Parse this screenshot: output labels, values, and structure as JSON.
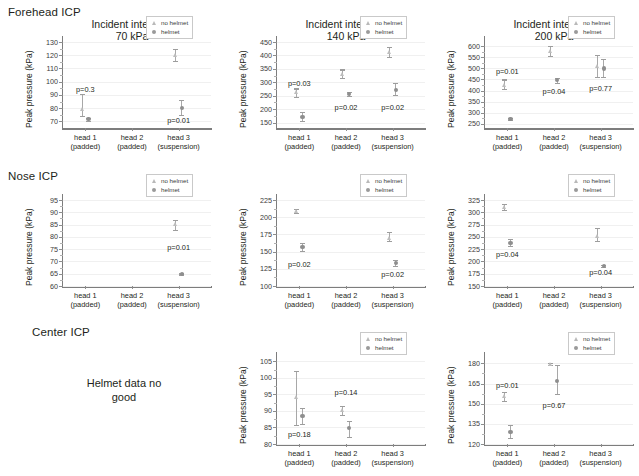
{
  "row_labels": [
    {
      "text": "Forehead ICP",
      "x": 8,
      "y": 6
    },
    {
      "text": "Nose ICP",
      "x": 8,
      "y": 170
    },
    {
      "text": "Center ICP",
      "x": 32,
      "y": 326
    }
  ],
  "legend": {
    "no_helmet": "no helmet",
    "helmet": "helmet",
    "no_helmet_icon": "triangle-marker-icon",
    "helmet_icon": "circle-marker-icon"
  },
  "note": {
    "line1": "Helmet data no",
    "line2": "good"
  },
  "axis_titles": {
    "y": "Peak pressure (kPa)"
  },
  "x_categories": [
    {
      "name": "head 1",
      "sub": "(padded)"
    },
    {
      "name": "head 2",
      "sub": "(padded)"
    },
    {
      "name": "head 3",
      "sub": "(suspension)"
    }
  ],
  "chart_data": [
    {
      "id": "forehead-70",
      "type": "scatter",
      "title": "Incident intensity:",
      "subtitle": "70 kPa",
      "row": "Forehead ICP",
      "ylabel": "Peak pressure (kPa)",
      "ylim": [
        65,
        130
      ],
      "yticks": [
        70,
        80,
        90,
        100,
        110,
        120,
        130
      ],
      "categories": [
        "head 1 (padded)",
        "head 2 (padded)",
        "head 3 (suspension)"
      ],
      "series": [
        {
          "name": "no helmet",
          "points": [
            {
              "category": "head 1",
              "value": 79.0,
              "low": 74.0,
              "high": 91.0
            },
            {
              "category": "head 2",
              "value": null,
              "low": null,
              "high": null
            },
            {
              "category": "head 3",
              "value": 120.0,
              "low": 115.5,
              "high": 124.5
            }
          ]
        },
        {
          "name": "helmet",
          "points": [
            {
              "category": "head 1",
              "value": 71.5,
              "low": 70.5,
              "high": 72.5
            },
            {
              "category": "head 2",
              "value": null,
              "low": null,
              "high": null
            },
            {
              "category": "head 3",
              "value": 80.0,
              "low": 75.0,
              "high": 86.0
            }
          ]
        }
      ],
      "annotations": [
        {
          "text": "p=0.3",
          "category": "head 1",
          "value": 93.5
        },
        {
          "text": "p=0.01",
          "category": "head 3",
          "value": 70.5
        }
      ]
    },
    {
      "id": "forehead-140",
      "type": "scatter",
      "title": "Incident intensity:",
      "subtitle": "140 kPa",
      "row": "Forehead ICP",
      "ylabel": "Peak pressure (kPa)",
      "ylim": [
        130,
        450
      ],
      "yticks": [
        150,
        200,
        250,
        300,
        350,
        400,
        450
      ],
      "categories": [
        "head 1 (padded)",
        "head 2 (padded)",
        "head 3 (suspension)"
      ],
      "series": [
        {
          "name": "no helmet",
          "points": [
            {
              "category": "head 1",
              "value": 262.0,
              "low": 246.0,
              "high": 277.0
            },
            {
              "category": "head 2",
              "value": 330.0,
              "low": 315.0,
              "high": 348.0
            },
            {
              "category": "head 3",
              "value": 412.0,
              "low": 393.0,
              "high": 430.0
            }
          ]
        },
        {
          "name": "helmet",
          "points": [
            {
              "category": "head 1",
              "value": 172.0,
              "low": 157.0,
              "high": 190.0
            },
            {
              "category": "head 2",
              "value": 257.0,
              "low": 250.0,
              "high": 265.0
            },
            {
              "category": "head 3",
              "value": 272.0,
              "low": 252.0,
              "high": 296.0
            }
          ]
        }
      ],
      "annotations": [
        {
          "text": "p=0.03",
          "category": "head 1",
          "value": 292.0
        },
        {
          "text": "p=0.02",
          "category": "head 2",
          "value": 203.0
        },
        {
          "text": "p=0.02",
          "category": "head 3",
          "value": 205.0
        }
      ]
    },
    {
      "id": "forehead-200",
      "type": "scatter",
      "title": "Incident intensity:",
      "subtitle": "200 kPa",
      "row": "Forehead ICP",
      "ylabel": "Peak pressure (kPa)",
      "ylim": [
        230,
        620
      ],
      "yticks": [
        250,
        300,
        350,
        400,
        450,
        500,
        550,
        600
      ],
      "categories": [
        "head 1 (padded)",
        "head 2 (padded)",
        "head 3 (suspension)"
      ],
      "series": [
        {
          "name": "no helmet",
          "points": [
            {
              "category": "head 1",
              "value": 425.0,
              "low": 408.0,
              "high": 450.0
            },
            {
              "category": "head 2",
              "value": 578.0,
              "low": 556.0,
              "high": 602.0
            },
            {
              "category": "head 3",
              "value": 512.0,
              "low": 460.0,
              "high": 562.0
            }
          ]
        },
        {
          "name": "helmet",
          "points": [
            {
              "category": "head 1",
              "value": 272.0,
              "low": 268.0,
              "high": 277.0
            },
            {
              "category": "head 2",
              "value": 446.0,
              "low": 436.0,
              "high": 455.0
            },
            {
              "category": "head 3",
              "value": 500.0,
              "low": 462.0,
              "high": 545.0
            }
          ]
        }
      ],
      "annotations": [
        {
          "text": "p=0.01",
          "category": "head 1",
          "value": 483.0
        },
        {
          "text": "p=0.04",
          "category": "head 2",
          "value": 392.0
        },
        {
          "text": "p=0.77",
          "category": "head 3",
          "value": 408.0
        }
      ]
    },
    {
      "id": "nose-70",
      "type": "scatter",
      "title": "",
      "subtitle": "",
      "row": "Nose ICP",
      "ylabel": "Peak pressure (kPa)",
      "ylim": [
        60,
        95
      ],
      "yticks": [
        60,
        65,
        70,
        75,
        80,
        85,
        90,
        95
      ],
      "categories": [
        "head 1 (padded)",
        "head 2 (padded)",
        "head 3 (suspension)"
      ],
      "series": [
        {
          "name": "no helmet",
          "points": [
            {
              "category": "head 1",
              "value": null,
              "low": null,
              "high": null
            },
            {
              "category": "head 2",
              "value": null,
              "low": null,
              "high": null
            },
            {
              "category": "head 3",
              "value": 85.3,
              "low": 82.8,
              "high": 87.0
            }
          ]
        },
        {
          "name": "helmet",
          "points": [
            {
              "category": "head 1",
              "value": null,
              "low": null,
              "high": null
            },
            {
              "category": "head 2",
              "value": null,
              "low": null,
              "high": null
            },
            {
              "category": "head 3",
              "value": 65.0,
              "low": 64.7,
              "high": 65.3
            }
          ]
        }
      ],
      "annotations": [
        {
          "text": "p=0.01",
          "category": "head 3",
          "value": 75.5
        }
      ]
    },
    {
      "id": "nose-140",
      "type": "scatter",
      "title": "",
      "subtitle": "",
      "row": "Nose ICP",
      "ylabel": "Peak pressure (kPa)",
      "ylim": [
        100,
        225
      ],
      "yticks": [
        100,
        125,
        150,
        175,
        200,
        225
      ],
      "categories": [
        "head 1 (padded)",
        "head 2 (padded)",
        "head 3 (suspension)"
      ],
      "series": [
        {
          "name": "no helmet",
          "points": [
            {
              "category": "head 1",
              "value": 209.0,
              "low": 206.0,
              "high": 212.0
            },
            {
              "category": "head 2",
              "value": null,
              "low": null,
              "high": null
            },
            {
              "category": "head 3",
              "value": 170.0,
              "low": 165.0,
              "high": 179.0
            }
          ]
        },
        {
          "name": "helmet",
          "points": [
            {
              "category": "head 1",
              "value": 157.0,
              "low": 151.0,
              "high": 163.0
            },
            {
              "category": "head 2",
              "value": null,
              "low": null,
              "high": null
            },
            {
              "category": "head 3",
              "value": 133.0,
              "low": 129.0,
              "high": 138.0
            }
          ]
        }
      ],
      "annotations": [
        {
          "text": "p=0.02",
          "category": "head 1",
          "value": 130.0
        },
        {
          "text": "p=0.02",
          "category": "head 3",
          "value": 116.0
        }
      ]
    },
    {
      "id": "nose-200",
      "type": "scatter",
      "title": "",
      "subtitle": "",
      "row": "Nose ICP",
      "ylabel": "Peak pressure (kPa)",
      "ylim": [
        150,
        325
      ],
      "yticks": [
        150,
        175,
        200,
        225,
        250,
        275,
        300,
        325
      ],
      "categories": [
        "head 1 (padded)",
        "head 2 (padded)",
        "head 3 (suspension)"
      ],
      "series": [
        {
          "name": "no helmet",
          "points": [
            {
              "category": "head 1",
              "value": 310.0,
              "low": 305.0,
              "high": 317.0
            },
            {
              "category": "head 2",
              "value": null,
              "low": null,
              "high": null
            },
            {
              "category": "head 3",
              "value": 252.0,
              "low": 241.0,
              "high": 268.0
            }
          ]
        },
        {
          "name": "helmet",
          "points": [
            {
              "category": "head 1",
              "value": 238.0,
              "low": 231.0,
              "high": 245.0
            },
            {
              "category": "head 2",
              "value": null,
              "low": null,
              "high": null
            },
            {
              "category": "head 3",
              "value": 191.0,
              "low": 189.0,
              "high": 193.0
            }
          ]
        }
      ],
      "annotations": [
        {
          "text": "p=0.04",
          "category": "head 1",
          "value": 214.0
        },
        {
          "text": "p=0.04",
          "category": "head 3",
          "value": 177.0
        }
      ]
    },
    {
      "id": "center-70",
      "type": "note",
      "row": "Center ICP",
      "note": "Helmet data no good"
    },
    {
      "id": "center-140",
      "type": "scatter",
      "title": "",
      "subtitle": "",
      "row": "Center ICP",
      "ylabel": "Peak pressure (kPa)",
      "ylim": [
        80,
        106
      ],
      "yticks": [
        80,
        85,
        90,
        95,
        100,
        105
      ],
      "categories": [
        "head 1 (padded)",
        "head 2 (padded)",
        "head 3 (suspension)"
      ],
      "series": [
        {
          "name": "no helmet",
          "points": [
            {
              "category": "head 1",
              "value": 94.2,
              "low": 85.8,
              "high": 102.0
            },
            {
              "category": "head 2",
              "value": 90.2,
              "low": 88.8,
              "high": 91.6
            },
            {
              "category": "head 3",
              "value": null,
              "low": null,
              "high": null
            }
          ]
        },
        {
          "name": "helmet",
          "points": [
            {
              "category": "head 1",
              "value": 88.4,
              "low": 86.0,
              "high": 91.0
            },
            {
              "category": "head 2",
              "value": 84.8,
              "low": 82.0,
              "high": 87.0
            },
            {
              "category": "head 3",
              "value": null,
              "low": null,
              "high": null
            }
          ]
        }
      ],
      "annotations": [
        {
          "text": "p=0.18",
          "category": "head 1",
          "value": 82.6
        },
        {
          "text": "p=0.14",
          "category": "head 2",
          "value": 95.4
        }
      ]
    },
    {
      "id": "center-200",
      "type": "scatter",
      "title": "",
      "subtitle": "",
      "row": "Center ICP",
      "ylabel": "Peak pressure (kPa)",
      "ylim": [
        120,
        184
      ],
      "yticks": [
        120,
        135,
        150,
        165,
        180
      ],
      "categories": [
        "head 1 (padded)",
        "head 2 (padded)",
        "head 3 (suspension)"
      ],
      "series": [
        {
          "name": "no helmet",
          "points": [
            {
              "category": "head 1",
              "value": 155.5,
              "low": 152.0,
              "high": 158.5
            },
            {
              "category": "head 2",
              "value": 179.5,
              "low": 178.5,
              "high": 180.5
            },
            {
              "category": "head 3",
              "value": null,
              "low": null,
              "high": null
            }
          ]
        },
        {
          "name": "helmet",
          "points": [
            {
              "category": "head 1",
              "value": 129.0,
              "low": 124.5,
              "high": 134.5
            },
            {
              "category": "head 2",
              "value": 167.0,
              "low": 157.5,
              "high": 179.0
            },
            {
              "category": "head 3",
              "value": null,
              "low": null,
              "high": null
            }
          ]
        }
      ],
      "annotations": [
        {
          "text": "p=0.01",
          "category": "head 1",
          "value": 163.5
        },
        {
          "text": "p=0.67",
          "category": "head 2",
          "value": 148.0
        }
      ]
    }
  ]
}
